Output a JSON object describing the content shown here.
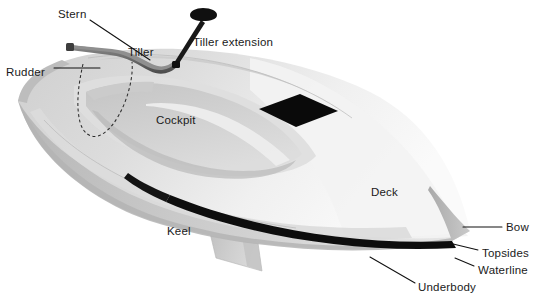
{
  "figure": {
    "type": "labeled-illustration",
    "background_color": "#ffffff",
    "ink_color": "#111111"
  },
  "labels": [
    {
      "id": "stern",
      "text": "Stern",
      "x": 58,
      "y": 14,
      "align": "start"
    },
    {
      "id": "tiller",
      "text": "Tiller",
      "x": 128,
      "y": 52,
      "align": "start"
    },
    {
      "id": "tiller-extension",
      "text": "Tiller extension",
      "x": 193,
      "y": 42,
      "align": "start"
    },
    {
      "id": "rudder",
      "text": "Rudder",
      "x": 6,
      "y": 72,
      "align": "start"
    },
    {
      "id": "cockpit",
      "text": "Cockpit",
      "x": 156,
      "y": 120,
      "align": "start"
    },
    {
      "id": "deck",
      "text": "Deck",
      "x": 371,
      "y": 192,
      "align": "start"
    },
    {
      "id": "keel",
      "text": "Keel",
      "x": 167,
      "y": 231,
      "align": "start"
    },
    {
      "id": "bow",
      "text": "Bow",
      "x": 506,
      "y": 231,
      "align": "start"
    },
    {
      "id": "topsides",
      "text": "Topsides",
      "x": 482,
      "y": 253,
      "align": "start"
    },
    {
      "id": "waterline",
      "text": "Waterline",
      "x": 478,
      "y": 270,
      "align": "start"
    },
    {
      "id": "underbody",
      "text": "Underbody",
      "x": 418,
      "y": 287,
      "align": "start"
    }
  ],
  "leaders": [
    {
      "id": "stern-leader",
      "points": "90,20 150,60"
    },
    {
      "id": "rudder-leader",
      "points": "54,68 100,68"
    },
    {
      "id": "tiller-extension-leader",
      "points": "203,36 210,22"
    },
    {
      "id": "bow-leader",
      "points": "463,227 502,227"
    },
    {
      "id": "topsides-leader",
      "points": "449,243 478,250"
    },
    {
      "id": "waterline-leader",
      "points": "455,258 474,266"
    },
    {
      "id": "underbody-leader",
      "points": "370,257 415,283"
    }
  ],
  "parts": {
    "hull": {
      "deck_fill_light": "#e8e8e8",
      "deck_fill_mid": "#d4d4d4",
      "topsides_fill": "#c6c6c6",
      "shadow_fill": "#b0b0b0",
      "waterline_stroke": "#0d0d0d"
    },
    "keel": {
      "fill": "#c9c9c9"
    },
    "tiller": {
      "fill": "#6e6e6e"
    },
    "tiller_extension": {
      "fill": "#1b1b1b"
    },
    "hatch": {
      "fill": "#0a0a0a",
      "shape": "diamond"
    },
    "rudder": {
      "stroke": "#2b2b2b",
      "style": "dashed-outline"
    }
  }
}
